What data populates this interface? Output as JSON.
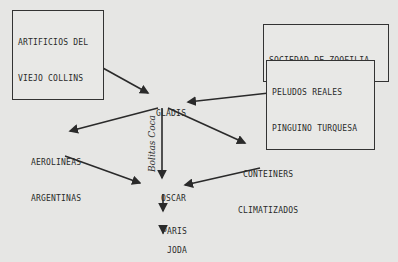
{
  "diagram": {
    "nodes": {
      "artificios": {
        "line1": "ARTIFICIOS DEL",
        "line2": "VIEJO COLLINS"
      },
      "sociedad": {
        "label": "SOCIEDAD DE ZOOFILIA"
      },
      "peludos": {
        "line1": "PELUDOS REALES",
        "line2": "PINGUINO TURQUESA"
      },
      "gladis": {
        "label": "GLADIS"
      },
      "aerolineas": {
        "line1": "AEROLINEAS",
        "line2": "ARGENTINAS"
      },
      "conteiners": {
        "line1": "CONTEINERS",
        "line2": "CLIMATIZADOS"
      },
      "oscar": {
        "label": "OSCAR"
      },
      "paris": {
        "label": "PARIS"
      },
      "joda": {
        "label": "JODA"
      }
    },
    "edge_label": "Bolitas Coca",
    "edges": [
      [
        "ARTIFICIOS DEL VIEJO COLLINS",
        "GLADIS"
      ],
      [
        "SOCIEDAD DE ZOOFILIA",
        "PELUDOS REALES PINGUINO TURQUESA"
      ],
      [
        "PELUDOS REALES PINGUINO TURQUESA",
        "GLADIS"
      ],
      [
        "GLADIS",
        "AEROLINEAS ARGENTINAS"
      ],
      [
        "GLADIS",
        "OSCAR"
      ],
      [
        "GLADIS",
        "CONTEINERS CLIMATIZADOS"
      ],
      [
        "AEROLINEAS ARGENTINAS",
        "OSCAR"
      ],
      [
        "CONTEINERS CLIMATIZADOS",
        "OSCAR"
      ],
      [
        "OSCAR",
        "PARIS"
      ],
      [
        "PARIS",
        "JODA"
      ]
    ]
  }
}
